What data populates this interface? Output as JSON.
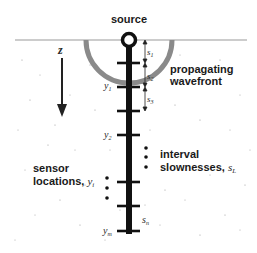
{
  "labels": {
    "source": "source",
    "z_axis": "z",
    "wavefront_line1": "propagating",
    "wavefront_line2": "wavefront",
    "interval_line1": "interval",
    "interval_line2": "slownesses, ",
    "interval_symbol": "s",
    "interval_sub": "L",
    "sensor_line1": "sensor",
    "sensor_line2": "locations, ",
    "sensor_symbol": "y",
    "sensor_sub": "i"
  },
  "sensors": [
    {
      "symbol": "y",
      "sub": "1"
    },
    {
      "symbol": "y",
      "sub": "2"
    },
    {
      "symbol": "y",
      "sub": "m"
    }
  ],
  "slownesses": [
    {
      "symbol": "s",
      "sub": "1"
    },
    {
      "symbol": "s",
      "sub": "2"
    },
    {
      "symbol": "s",
      "sub": "3"
    },
    {
      "symbol": "s",
      "sub": "n"
    }
  ],
  "colors": {
    "borehole": "#111111",
    "wavefront": "#8a8a8a",
    "surface": "#9a9a9a",
    "text": "#1a1a1a"
  }
}
